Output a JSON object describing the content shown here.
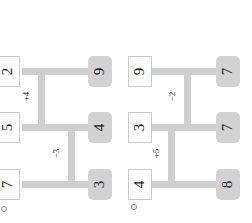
{
  "canvas": {
    "width": 252,
    "height": 223,
    "background": "#ffffff"
  },
  "style": {
    "pipe_color": "#cfcfcf",
    "plain_node_fill": "#ffffff",
    "plain_node_border": "#c9c9c9",
    "filled_node_fill": "#d2d2d2",
    "text_color": "#1a1a1a",
    "marker_color": "#8a8a8a"
  },
  "diagrams": [
    {
      "id": "left",
      "marker": "circle-marker",
      "left_nodes": [
        {
          "label": "2",
          "row": "top"
        },
        {
          "label": "5",
          "row": "middle"
        },
        {
          "label": "7",
          "row": "bottom"
        }
      ],
      "right_nodes": [
        {
          "label": "9",
          "row": "top"
        },
        {
          "label": "4",
          "row": "middle"
        },
        {
          "label": "3",
          "row": "bottom"
        }
      ],
      "edge_labels": [
        {
          "label": "+4",
          "branch": "upper"
        },
        {
          "label": "−3",
          "branch": "lower"
        }
      ]
    },
    {
      "id": "right",
      "marker": "circle-marker",
      "left_nodes": [
        {
          "label": "9",
          "row": "top"
        },
        {
          "label": "3",
          "row": "middle"
        },
        {
          "label": "4",
          "row": "bottom"
        }
      ],
      "right_nodes": [
        {
          "label": "7",
          "row": "top"
        },
        {
          "label": "7",
          "row": "middle"
        },
        {
          "label": "8",
          "row": "bottom"
        }
      ],
      "edge_labels": [
        {
          "label": "−2",
          "branch": "upper"
        },
        {
          "label": "+5",
          "branch": "lower"
        }
      ]
    }
  ]
}
